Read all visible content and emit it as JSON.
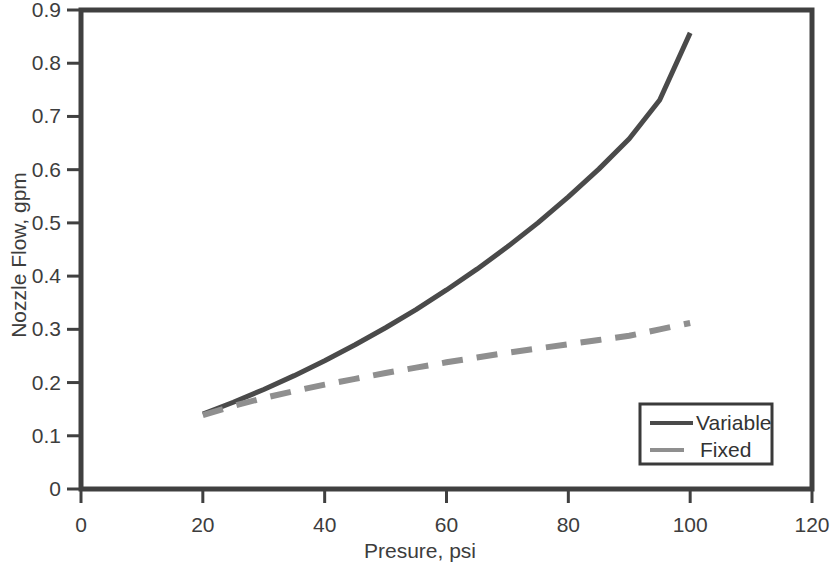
{
  "chart_data": {
    "type": "line",
    "title": "",
    "xlabel": "Presure, psi",
    "ylabel": "Nozzle Flow, gpm",
    "xlim": [
      0,
      120
    ],
    "ylim": [
      0,
      0.9
    ],
    "xticks": [
      "0",
      "20",
      "40",
      "60",
      "80",
      "100",
      "120"
    ],
    "yticks": [
      "0",
      "0.1",
      "0.2",
      "0.3",
      "0.4",
      "0.5",
      "0.6",
      "0.7",
      "0.8",
      "0.9"
    ],
    "xtick_values": [
      0,
      20,
      40,
      60,
      80,
      100,
      120
    ],
    "ytick_values": [
      0,
      0.1,
      0.2,
      0.3,
      0.4,
      0.5,
      0.6,
      0.7,
      0.8,
      0.9
    ],
    "grid": false,
    "legend_position": "lower right",
    "x": [
      20,
      25,
      30,
      35,
      40,
      45,
      50,
      55,
      60,
      65,
      70,
      75,
      80,
      85,
      90,
      95,
      100
    ],
    "series": [
      {
        "name": "Variable",
        "color": "#4a4a4a",
        "style": "solid",
        "values": [
          0.141,
          0.163,
          0.187,
          0.213,
          0.241,
          0.271,
          0.303,
          0.337,
          0.374,
          0.413,
          0.455,
          0.5,
          0.549,
          0.601,
          0.658,
          0.731,
          0.857
        ]
      },
      {
        "name": "Fixed",
        "color": "#8f8f8f",
        "style": "dashed",
        "values": [
          0.139,
          0.156,
          0.171,
          0.184,
          0.196,
          0.207,
          0.218,
          0.228,
          0.238,
          0.247,
          0.256,
          0.264,
          0.272,
          0.28,
          0.288,
          0.3,
          0.312
        ]
      }
    ]
  },
  "legend": {
    "entries": [
      {
        "label": "Variable"
      },
      {
        "label": "Fixed"
      }
    ]
  },
  "colors": {
    "variable_line": "#4a4a4a",
    "fixed_line": "#8f8f8f",
    "frame": "#404040",
    "text": "#3d3d3d",
    "background": "#ffffff"
  }
}
